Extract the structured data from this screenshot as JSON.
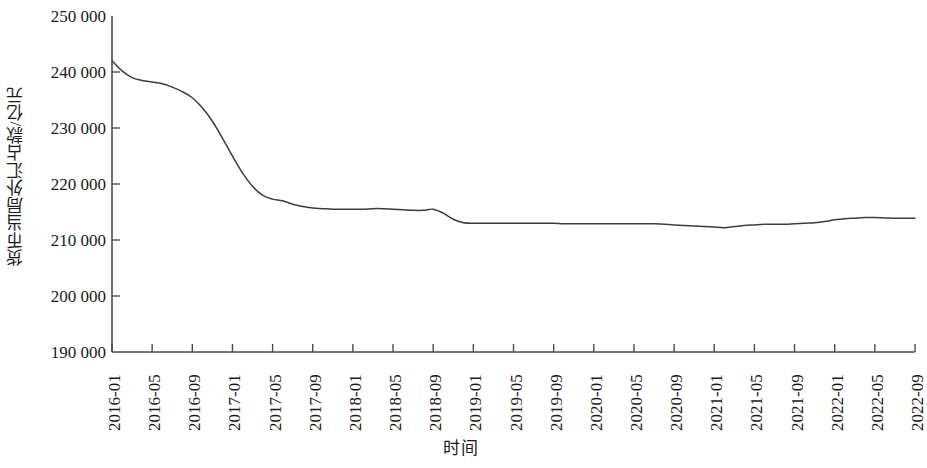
{
  "chart_data": {
    "type": "line",
    "title": "",
    "xlabel": "时间",
    "ylabel": "货币当局外汇占款/亿元",
    "ylim": [
      190000,
      250000
    ],
    "y_ticks": [
      250000,
      240000,
      230000,
      220000,
      210000,
      200000,
      190000
    ],
    "y_tick_labels": [
      "250 000",
      "240 000",
      "230 000",
      "220 000",
      "210 000",
      "200 000",
      "190 000"
    ],
    "grid": false,
    "legend": null,
    "line_color": "#3c3c3c",
    "line_width": 1.5,
    "x_tick_labels": [
      "2016-01",
      "2016-05",
      "2016-09",
      "2017-01",
      "2017-05",
      "2017-09",
      "2018-01",
      "2018-05",
      "2018-09",
      "2019-01",
      "2019-05",
      "2019-09",
      "2020-01",
      "2020-05",
      "2020-09",
      "2021-01",
      "2021-05",
      "2021-09",
      "2022-01",
      "2022-05",
      "2022-09"
    ],
    "x": [
      "2016-01",
      "2016-02",
      "2016-03",
      "2016-04",
      "2016-05",
      "2016-06",
      "2016-07",
      "2016-08",
      "2016-09",
      "2016-10",
      "2016-11",
      "2016-12",
      "2017-01",
      "2017-02",
      "2017-03",
      "2017-04",
      "2017-05",
      "2017-06",
      "2017-07",
      "2017-08",
      "2017-09",
      "2017-10",
      "2017-11",
      "2017-12",
      "2018-01",
      "2018-02",
      "2018-03",
      "2018-04",
      "2018-05",
      "2018-06",
      "2018-07",
      "2018-08",
      "2018-09",
      "2018-10",
      "2018-11",
      "2018-12",
      "2019-01",
      "2019-02",
      "2019-03",
      "2019-04",
      "2019-05",
      "2019-06",
      "2019-07",
      "2019-08",
      "2019-09",
      "2019-10",
      "2019-11",
      "2019-12",
      "2020-01",
      "2020-02",
      "2020-03",
      "2020-04",
      "2020-05",
      "2020-06",
      "2020-07",
      "2020-08",
      "2020-09",
      "2020-10",
      "2020-11",
      "2020-12",
      "2021-01",
      "2021-02",
      "2021-03",
      "2021-04",
      "2021-05",
      "2021-06",
      "2021-07",
      "2021-08",
      "2021-09",
      "2021-10",
      "2021-11",
      "2021-12",
      "2022-01",
      "2022-02",
      "2022-03",
      "2022-04",
      "2022-05",
      "2022-06",
      "2022-07",
      "2022-08",
      "2022-09"
    ],
    "values": [
      242000,
      240200,
      239000,
      238500,
      238200,
      237900,
      237300,
      236500,
      235400,
      233600,
      231200,
      228200,
      225000,
      222000,
      219600,
      218000,
      217300,
      217000,
      216400,
      216000,
      215700,
      215600,
      215500,
      215500,
      215500,
      215500,
      215600,
      215600,
      215500,
      215400,
      215300,
      215300,
      215500,
      214800,
      213700,
      213100,
      213000,
      213000,
      213000,
      213000,
      213000,
      213000,
      213000,
      213000,
      213000,
      212900,
      212900,
      212900,
      212900,
      212900,
      212900,
      212900,
      212900,
      212900,
      212900,
      212800,
      212700,
      212600,
      212500,
      212400,
      212300,
      212200,
      212400,
      212600,
      212700,
      212800,
      212800,
      212800,
      212900,
      213000,
      213100,
      213300,
      213600,
      213800,
      213900,
      214000,
      214000,
      213950,
      213900,
      213900,
      213900
    ],
    "series_name": "货币当局外汇占款"
  },
  "axis": {
    "x_title": "时间",
    "y_title": "货币当局外汇占款/亿元"
  }
}
